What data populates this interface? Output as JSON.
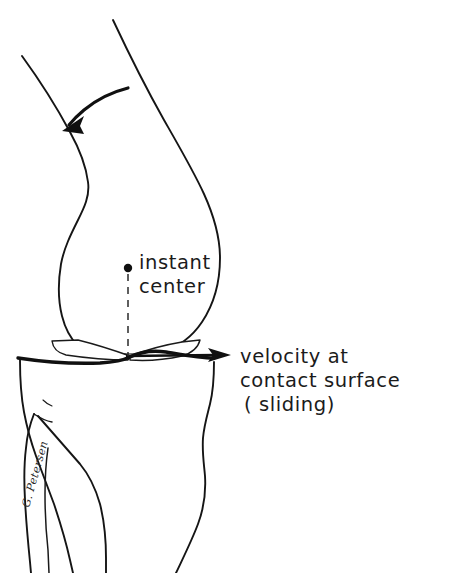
{
  "figure": {
    "background_color": "#ffffff",
    "ink_color": "#151515",
    "width": 461,
    "height": 573
  },
  "labels": {
    "instant_center_line1": "instant",
    "instant_center_line2": "center",
    "velocity_line1": "velocity at",
    "velocity_line2": "contact surface",
    "velocity_line3": "( sliding)"
  },
  "signature": {
    "text": "G. Petersen"
  },
  "annotations": {
    "rotation_arrow_name": "flexion-rotation-arrow",
    "velocity_arrow_name": "velocity-vector-arrow",
    "instant_center_marker": "instant-center-dot",
    "drop_line": "instant-center-drop-line"
  },
  "anatomy": {
    "femur": "femur-outline",
    "tibia": "tibia-outline",
    "fibula": "fibula-outline",
    "meniscus_anterior": "anterior-meniscus",
    "meniscus_posterior": "posterior-meniscus",
    "joint_line": "tibiofemoral-joint-line"
  },
  "geometry": {
    "instant_center_x": 128,
    "instant_center_y": 268,
    "drop_line_bottom_y": 356,
    "velocity_arrow_tip_x": 230,
    "velocity_arrow_y": 355
  }
}
